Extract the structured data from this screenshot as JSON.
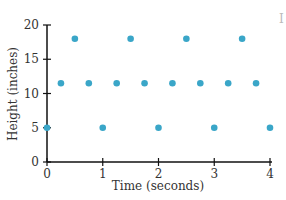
{
  "chart_data": {
    "type": "scatter",
    "title": "",
    "xlabel": "Time (seconds)",
    "ylabel": "Height (inches)",
    "xlim": [
      0,
      4
    ],
    "ylim": [
      0,
      20
    ],
    "xticks": [
      0,
      1,
      2,
      3,
      4
    ],
    "yticks": [
      0,
      5,
      10,
      15,
      20
    ],
    "grid": false,
    "legend": null,
    "marker_color": "#3aa6c8",
    "series": [
      {
        "name": "Height",
        "points": [
          {
            "x": 0,
            "y": 5
          },
          {
            "x": 0.25,
            "y": 11.5
          },
          {
            "x": 0.5,
            "y": 18
          },
          {
            "x": 0.75,
            "y": 11.5
          },
          {
            "x": 1,
            "y": 5
          },
          {
            "x": 1.25,
            "y": 11.5
          },
          {
            "x": 1.5,
            "y": 18
          },
          {
            "x": 1.75,
            "y": 11.5
          },
          {
            "x": 2,
            "y": 5
          },
          {
            "x": 2.25,
            "y": 11.5
          },
          {
            "x": 2.5,
            "y": 18
          },
          {
            "x": 2.75,
            "y": 11.5
          },
          {
            "x": 3,
            "y": 5
          },
          {
            "x": 3.25,
            "y": 11.5
          },
          {
            "x": 3.5,
            "y": 18
          },
          {
            "x": 3.75,
            "y": 11.5
          },
          {
            "x": 4,
            "y": 5
          }
        ]
      }
    ]
  }
}
